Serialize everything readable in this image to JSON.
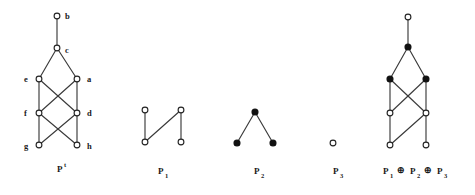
{
  "figure": {
    "background_color": "#ffffff",
    "node_open_fill": "#ffffff",
    "node_filled_fill": "#111111",
    "edge_color": "#3a3a3a",
    "text_color": "#1a1a1a"
  },
  "diagrams": [
    {
      "id": "pt",
      "label_base": "P",
      "label_sup": "t",
      "label_sub": "",
      "label_x": 57,
      "label_y": 172,
      "node_style": "open",
      "vertices": [
        {
          "name": "b",
          "x": 57,
          "y": 16,
          "style": "open",
          "label": "b",
          "label_x": 65,
          "label_y": 19
        },
        {
          "name": "c",
          "x": 57,
          "y": 48,
          "style": "open",
          "label": "c",
          "label_x": 65,
          "label_y": 53
        },
        {
          "name": "e",
          "x": 39,
          "y": 79,
          "style": "open",
          "label": "e",
          "label_x": 24,
          "label_y": 82
        },
        {
          "name": "a",
          "x": 77,
          "y": 79,
          "style": "open",
          "label": "a",
          "label_x": 87,
          "label_y": 82
        },
        {
          "name": "f",
          "x": 39,
          "y": 113,
          "style": "open",
          "label": "f",
          "label_x": 24,
          "label_y": 116
        },
        {
          "name": "d",
          "x": 77,
          "y": 113,
          "style": "open",
          "label": "d",
          "label_x": 87,
          "label_y": 116
        },
        {
          "name": "g",
          "x": 39,
          "y": 145,
          "style": "open",
          "label": "g",
          "label_x": 24,
          "label_y": 149
        },
        {
          "name": "h",
          "x": 77,
          "y": 145,
          "style": "open",
          "label": "h",
          "label_x": 87,
          "label_y": 149
        }
      ],
      "edges": [
        [
          "b",
          "c"
        ],
        [
          "c",
          "e"
        ],
        [
          "c",
          "a"
        ],
        [
          "e",
          "f"
        ],
        [
          "a",
          "d"
        ],
        [
          "e",
          "d"
        ],
        [
          "a",
          "f"
        ],
        [
          "f",
          "g"
        ],
        [
          "d",
          "h"
        ],
        [
          "f",
          "h"
        ],
        [
          "d",
          "g"
        ]
      ]
    },
    {
      "id": "p1",
      "label_base": "P",
      "label_sup": "",
      "label_sub": "1",
      "label_x": 158,
      "label_y": 174,
      "node_style": "open",
      "vertices": [
        {
          "name": "p1-top-left",
          "x": 145,
          "y": 110,
          "style": "open",
          "label": "",
          "label_x": 0,
          "label_y": 0
        },
        {
          "name": "p1-bottom-left",
          "x": 145,
          "y": 142,
          "style": "open",
          "label": "",
          "label_x": 0,
          "label_y": 0
        },
        {
          "name": "p1-top-right",
          "x": 181,
          "y": 110,
          "style": "open",
          "label": "",
          "label_x": 0,
          "label_y": 0
        },
        {
          "name": "p1-bottom-right",
          "x": 181,
          "y": 142,
          "style": "open",
          "label": "",
          "label_x": 0,
          "label_y": 0
        }
      ],
      "edges": [
        [
          "p1-top-left",
          "p1-bottom-left"
        ],
        [
          "p1-bottom-left",
          "p1-top-right"
        ],
        [
          "p1-top-right",
          "p1-bottom-right"
        ]
      ]
    },
    {
      "id": "p2",
      "label_base": "P",
      "label_sup": "",
      "label_sub": "2",
      "label_x": 254,
      "label_y": 174,
      "node_style": "filled",
      "vertices": [
        {
          "name": "p2-apex",
          "x": 255,
          "y": 112,
          "style": "filled",
          "label": "",
          "label_x": 0,
          "label_y": 0
        },
        {
          "name": "p2-bottom-left",
          "x": 237,
          "y": 143,
          "style": "filled",
          "label": "",
          "label_x": 0,
          "label_y": 0
        },
        {
          "name": "p2-bottom-right",
          "x": 273,
          "y": 143,
          "style": "filled",
          "label": "",
          "label_x": 0,
          "label_y": 0
        }
      ],
      "edges": [
        [
          "p2-apex",
          "p2-bottom-left"
        ],
        [
          "p2-apex",
          "p2-bottom-right"
        ]
      ]
    },
    {
      "id": "p3",
      "label_base": "P",
      "label_sup": "",
      "label_sub": "3",
      "label_x": 333,
      "label_y": 174,
      "node_style": "open",
      "vertices": [
        {
          "name": "p3-single",
          "x": 333,
          "y": 143,
          "style": "open",
          "label": "",
          "label_x": 0,
          "label_y": 0
        }
      ],
      "edges": []
    },
    {
      "id": "sum",
      "label_base": "",
      "label_sup": "",
      "label_sub": "",
      "label_x": 0,
      "label_y": 0,
      "node_style": "mixed",
      "vertices": [
        {
          "name": "s-top",
          "x": 408,
          "y": 17,
          "style": "open",
          "label": "",
          "label_x": 0,
          "label_y": 0
        },
        {
          "name": "s-apex",
          "x": 408,
          "y": 47,
          "style": "filled",
          "label": "",
          "label_x": 0,
          "label_y": 0
        },
        {
          "name": "s-mid-left",
          "x": 390,
          "y": 79,
          "style": "filled",
          "label": "",
          "label_x": 0,
          "label_y": 0
        },
        {
          "name": "s-mid-right",
          "x": 426,
          "y": 79,
          "style": "filled",
          "label": "",
          "label_x": 0,
          "label_y": 0
        },
        {
          "name": "s-low-left",
          "x": 390,
          "y": 113,
          "style": "open",
          "label": "",
          "label_x": 0,
          "label_y": 0
        },
        {
          "name": "s-low-right",
          "x": 426,
          "y": 113,
          "style": "open",
          "label": "",
          "label_x": 0,
          "label_y": 0
        },
        {
          "name": "s-bottom-left",
          "x": 390,
          "y": 145,
          "style": "open",
          "label": "",
          "label_x": 0,
          "label_y": 0
        },
        {
          "name": "s-bottom-right",
          "x": 426,
          "y": 145,
          "style": "open",
          "label": "",
          "label_x": 0,
          "label_y": 0
        }
      ],
      "edges": [
        [
          "s-top",
          "s-apex"
        ],
        [
          "s-apex",
          "s-mid-left"
        ],
        [
          "s-apex",
          "s-mid-right"
        ],
        [
          "s-mid-left",
          "s-low-left"
        ],
        [
          "s-mid-right",
          "s-low-right"
        ],
        [
          "s-mid-left",
          "s-low-right"
        ],
        [
          "s-mid-right",
          "s-low-left"
        ],
        [
          "s-low-left",
          "s-bottom-left"
        ],
        [
          "s-low-right",
          "s-bottom-right"
        ],
        [
          "s-bottom-left",
          "s-low-right"
        ]
      ]
    }
  ],
  "sum_label": {
    "name": "sum-caption",
    "parts": [
      {
        "kind": "base",
        "text": "P",
        "x": 383,
        "y": 174
      },
      {
        "kind": "sub",
        "text": "1",
        "x": 390,
        "y": 178
      },
      {
        "kind": "op",
        "text": "⊕",
        "x": 397,
        "y": 173
      },
      {
        "kind": "base",
        "text": "P",
        "x": 410,
        "y": 174
      },
      {
        "kind": "sub",
        "text": "2",
        "x": 417,
        "y": 178
      },
      {
        "kind": "op",
        "text": "⊕",
        "x": 424,
        "y": 173
      },
      {
        "kind": "base",
        "text": "P",
        "x": 437,
        "y": 174
      },
      {
        "kind": "sub",
        "text": "3",
        "x": 444,
        "y": 178
      }
    ]
  }
}
